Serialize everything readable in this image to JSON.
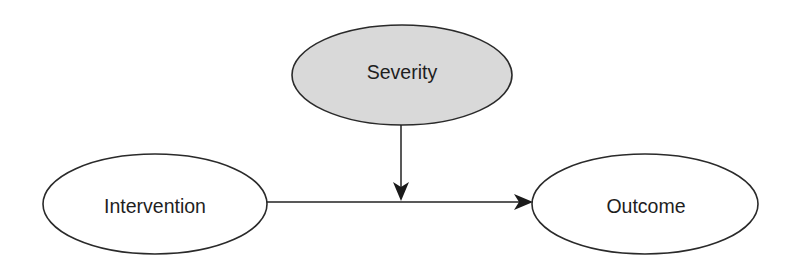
{
  "diagram": {
    "type": "causal-moderation-diagram",
    "nodes": {
      "severity": {
        "label": "Severity",
        "fill": "#d9d9d9",
        "role": "moderator"
      },
      "intervention": {
        "label": "Intervention",
        "fill": "#ffffff",
        "role": "cause"
      },
      "outcome": {
        "label": "Outcome",
        "fill": "#ffffff",
        "role": "effect"
      }
    },
    "edges": [
      {
        "from": "intervention",
        "to": "outcome",
        "style": "arrow"
      },
      {
        "from": "severity",
        "to": "intervention-outcome-edge",
        "style": "arrow"
      }
    ],
    "colors": {
      "stroke": "#2a2a2a",
      "moderator_fill": "#d9d9d9",
      "background": "#ffffff"
    }
  }
}
